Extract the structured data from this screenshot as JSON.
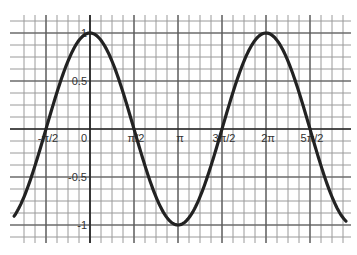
{
  "chart_data": {
    "type": "line",
    "title": "",
    "xlabel": "",
    "ylabel": "",
    "function": "y = cos(x)",
    "grid": true,
    "xlim": [
      -2.71,
      9.14
    ],
    "ylim": [
      -1.125,
      1.125
    ],
    "x_ticks": [
      {
        "value": -1.5708,
        "label": "-π/2"
      },
      {
        "value": 0,
        "label": "0"
      },
      {
        "value": 1.5708,
        "label": "π/2"
      },
      {
        "value": 3.1416,
        "label": "π"
      },
      {
        "value": 4.7124,
        "label": "3π/2"
      },
      {
        "value": 6.2832,
        "label": "2π"
      },
      {
        "value": 7.854,
        "label": "5π/2"
      }
    ],
    "y_ticks": [
      {
        "value": 1,
        "label": "1"
      },
      {
        "value": 0.5,
        "label": "0.5"
      },
      {
        "value": -0.5,
        "label": "-0.5"
      },
      {
        "value": -1,
        "label": "-1"
      }
    ],
    "series": [
      {
        "name": "cos(x)",
        "color": "#222222",
        "x": [
          -2.71,
          -1.5708,
          0,
          1.5708,
          3.1416,
          4.7124,
          6.2832,
          7.854,
          9.14
        ],
        "values": [
          -0.91,
          0,
          1,
          0,
          -1,
          0,
          1,
          0,
          -0.96
        ]
      }
    ]
  },
  "colors": {
    "grid": "#9a9a9a",
    "axis": "#222222",
    "curve": "#222222"
  }
}
